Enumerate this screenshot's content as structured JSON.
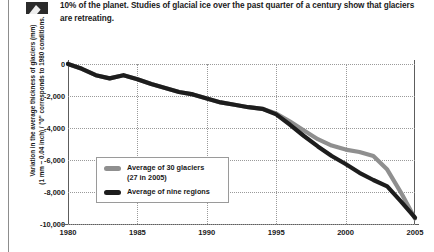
{
  "caption": {
    "icon": "mountain-chart-icon",
    "text": "10% of the planet. Studies of glacial ice over the past quarter of a century show that glaciers are retreating."
  },
  "chart_data": {
    "type": "line",
    "title": "",
    "xlabel": "",
    "ylabel_line1": "Variation in the average thickness of glaciers (mm)",
    "ylabel_line2": "(1 mm ~ 0.04 inch) / \"0\" corresponds to 1980 conditions.",
    "xlim": [
      1980,
      2005
    ],
    "ylim": [
      -10000,
      0
    ],
    "xticks": [
      "1980",
      "1985",
      "1990",
      "1995",
      "2000",
      "2005"
    ],
    "xtick_values": [
      1980,
      1985,
      1990,
      1995,
      2000,
      2005
    ],
    "yticks": [
      "0",
      "-2,000",
      "-4,000",
      "-6,000",
      "-8,000",
      "-10,000"
    ],
    "ytick_values": [
      0,
      -2000,
      -4000,
      -6000,
      -8000,
      -10000
    ],
    "grid": true,
    "legend_position": "inside-lower-left",
    "x": [
      1980,
      1981,
      1982,
      1983,
      1984,
      1985,
      1986,
      1987,
      1988,
      1989,
      1990,
      1991,
      1992,
      1993,
      1994,
      1995,
      1996,
      1997,
      1998,
      1999,
      2000,
      2001,
      2002,
      2003,
      2004,
      2005
    ],
    "series": [
      {
        "name": "Average of 30 glaciers",
        "name_sub": "(27 in 2005)",
        "color": "#8f8f8f",
        "values": [
          0,
          -300,
          -700,
          -900,
          -700,
          -950,
          -1250,
          -1500,
          -1750,
          -1900,
          -2150,
          -2400,
          -2550,
          -2700,
          -2800,
          -3100,
          -3600,
          -4150,
          -4700,
          -5100,
          -5350,
          -5500,
          -5750,
          -6600,
          -8050,
          -9650
        ]
      },
      {
        "name": "Average of nine regions",
        "name_sub": "",
        "color": "#1d1d1d",
        "values": [
          0,
          -300,
          -700,
          -900,
          -700,
          -950,
          -1250,
          -1500,
          -1750,
          -1900,
          -2150,
          -2400,
          -2550,
          -2700,
          -2800,
          -3150,
          -3800,
          -4500,
          -5150,
          -5750,
          -6250,
          -6800,
          -7250,
          -7650,
          -8600,
          -9600
        ]
      }
    ]
  },
  "legend": {
    "items": [
      {
        "label": "Average of 30 glaciers",
        "sub": "(27 in 2005)",
        "color": "#8f8f8f"
      },
      {
        "label": "Average of nine regions",
        "sub": "",
        "color": "#1d1d1d"
      }
    ]
  }
}
